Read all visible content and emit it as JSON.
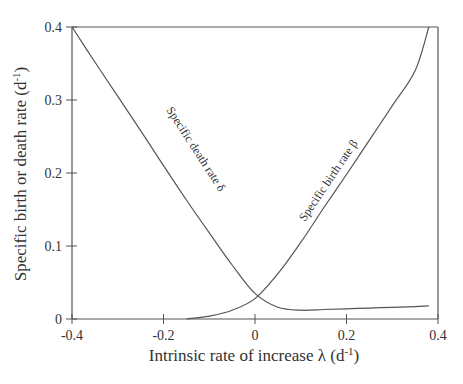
{
  "chart_data": {
    "type": "line",
    "title": "",
    "xlabel": "Intrinsic rate of increase λ (d⁻¹)",
    "ylabel": "Specific birth or death rate (d⁻¹)",
    "xlim": [
      -0.4,
      0.4
    ],
    "ylim": [
      0,
      0.4
    ],
    "x_ticks": [
      "-0.4",
      "-0.2",
      "0",
      "0.2",
      "0.4"
    ],
    "y_ticks": [
      "0",
      "0.1",
      "0.2",
      "0.3",
      "0.4"
    ],
    "grid": false,
    "legend": "none (curves labeled inline)",
    "series": [
      {
        "name": "Specific death rate δ",
        "x": [
          -0.4,
          -0.35,
          -0.3,
          -0.25,
          -0.2,
          -0.15,
          -0.1,
          -0.05,
          0.0,
          0.05,
          0.1,
          0.15,
          0.2,
          0.25,
          0.3,
          0.35,
          0.38
        ],
        "values": [
          0.4,
          0.352,
          0.305,
          0.258,
          0.21,
          0.163,
          0.118,
          0.074,
          0.035,
          0.016,
          0.012,
          0.013,
          0.014,
          0.015,
          0.016,
          0.017,
          0.018
        ]
      },
      {
        "name": "Specific birth rate β",
        "x": [
          -0.15,
          -0.1,
          -0.05,
          0.0,
          0.05,
          0.1,
          0.15,
          0.2,
          0.25,
          0.3,
          0.35,
          0.38
        ],
        "values": [
          0.0,
          0.004,
          0.012,
          0.028,
          0.062,
          0.105,
          0.152,
          0.198,
          0.245,
          0.292,
          0.34,
          0.4
        ]
      }
    ],
    "annotations": [
      {
        "text": "Specific death rate δ",
        "near": [
          -0.19,
          0.26
        ]
      },
      {
        "text": "Specific birth rate β",
        "near": [
          0.17,
          0.24
        ]
      }
    ]
  },
  "labels": {
    "x_axis": "Intrinsic rate of increase λ (d",
    "x_axis_sup": "-1",
    "x_axis_end": ")",
    "y_axis": "Specific birth or death rate (d",
    "y_axis_sup": "-1",
    "y_axis_end": ")",
    "death_curve": "Specific death rate δ",
    "birth_curve": "Specific birth rate β"
  },
  "colors": {
    "curve": "#555555",
    "axis": "#444444",
    "text": "#333333"
  }
}
